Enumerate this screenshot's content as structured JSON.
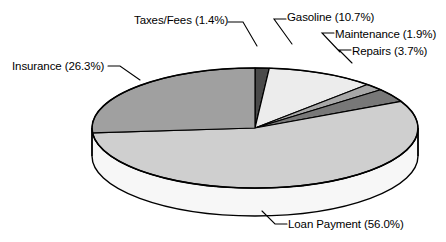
{
  "chart_data": {
    "type": "pie",
    "title": "",
    "subtitle": "",
    "xlabel": "",
    "ylabel": "",
    "legend_position": "none",
    "grid": false,
    "style": "3d-exploded-none",
    "value_unit": "percent",
    "categories": [
      "Taxes/Fees",
      "Gasoline",
      "Maintenance",
      "Repairs",
      "Loan Payment",
      "Insurance"
    ],
    "values": [
      1.4,
      10.7,
      1.9,
      3.7,
      56.0,
      26.3
    ],
    "labels": [
      "Taxes/Fees (1.4%)",
      "Gasoline (10.7%)",
      "Maintenance (1.9%)",
      "Repairs (3.7%)",
      "Loan Payment (56.0%)",
      "Insurance (26.3%)"
    ],
    "slices": [
      {
        "name": "Taxes/Fees",
        "value": 1.4,
        "label": "Taxes/Fees (1.4%)",
        "color": "#4a4a4a"
      },
      {
        "name": "Gasoline",
        "value": 10.7,
        "label": "Gasoline (10.7%)",
        "color": "#ececec"
      },
      {
        "name": "Maintenance",
        "value": 1.9,
        "label": "Maintenance (1.9%)",
        "color": "#a8a8a8"
      },
      {
        "name": "Repairs",
        "value": 3.7,
        "label": "Repairs (3.7%)",
        "color": "#787878"
      },
      {
        "name": "Loan Payment",
        "value": 56.0,
        "label": "Loan Payment (56.0%)",
        "color": "#cfcfcf"
      },
      {
        "name": "Insurance",
        "value": 26.3,
        "label": "Insurance (26.3%)",
        "color": "#a0a0a0"
      }
    ],
    "colors": {
      "taxes": "#4a4a4a",
      "gasoline": "#ececec",
      "maintenance": "#a8a8a8",
      "repairs": "#787878",
      "loan_payment": "#cfcfcf",
      "insurance": "#a0a0a0",
      "side_wall": "#f7f7f7",
      "outline": "#000000",
      "background": "#ffffff",
      "leader_line": "#000000",
      "label_text": "#000000"
    }
  }
}
